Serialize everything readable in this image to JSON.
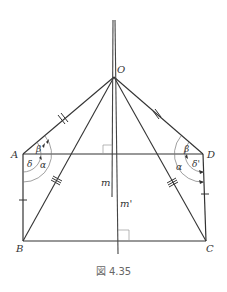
{
  "figure": {
    "caption": "図 4.35",
    "points": {
      "O": {
        "label": "O",
        "x": 114,
        "y": 77
      },
      "A": {
        "label": "A",
        "x": 23,
        "y": 154
      },
      "D": {
        "label": "D",
        "x": 203,
        "y": 154
      },
      "B": {
        "label": "B",
        "x": 23,
        "y": 241
      },
      "C": {
        "label": "C",
        "x": 206,
        "y": 241
      }
    },
    "lines": {
      "m": {
        "label": "m"
      },
      "m_prime": {
        "label": "m'"
      }
    },
    "angles": {
      "left": {
        "alpha": "α",
        "beta": "β",
        "delta": "δ"
      },
      "right": {
        "alpha": "α",
        "beta": "β",
        "delta": "δ'"
      }
    },
    "colors": {
      "stroke": "#333333",
      "thin": "#777777",
      "text": "#333333",
      "caption": "#666666"
    }
  }
}
